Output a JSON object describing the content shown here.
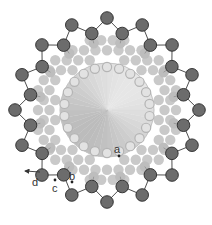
{
  "diagram": {
    "center": [
      107,
      110
    ],
    "colors": {
      "background": "#ffffff",
      "outer_atom_fill": "#6c6c6c",
      "outer_atom_stroke": "#2a2a2a",
      "bond": "#3a3a3a",
      "filler_atom": "#c9c9c9",
      "inner_ring_atom_fill": "#e2e2e2",
      "inner_ring_atom_stroke": "#b4b4b4",
      "second_row_atom": "#bdbdbd",
      "disc_light": "#e6e6e6",
      "disc_dark": "#bcbcbc",
      "label": "#333333"
    },
    "outer_zigzag": {
      "pairs": 16,
      "r_outer": 92,
      "r_inner": 78,
      "atom_radius": 6.3,
      "phase_deg": -90
    },
    "second_row": {
      "count": 16,
      "r": 68,
      "atom_radius": 5.2,
      "phase_deg": -78.75
    },
    "inner_disc": {
      "r": 47
    },
    "inner_ring_atoms": {
      "count": 22,
      "r": 43,
      "atom_radius": 4.6
    },
    "filler": {
      "spacing": 11.5,
      "r_min": 52,
      "r_max": 74,
      "atom_radius": 5.2
    },
    "labels": [
      {
        "id": "a",
        "text": "a",
        "x": 114,
        "y": 153
      },
      {
        "id": "b",
        "text": "b",
        "x": 69,
        "y": 180
      },
      {
        "id": "c",
        "text": "c",
        "x": 52,
        "y": 192
      },
      {
        "id": "d",
        "text": "d",
        "x": 32,
        "y": 186
      }
    ],
    "markers": [
      {
        "id": "a",
        "x": 119,
        "y": 156
      },
      {
        "id": "b",
        "x": 72,
        "y": 182
      },
      {
        "id": "c",
        "x": 55,
        "y": 180
      }
    ],
    "arrow": {
      "x1": 40,
      "y1": 172,
      "x2": 25,
      "y2": 171
    }
  }
}
